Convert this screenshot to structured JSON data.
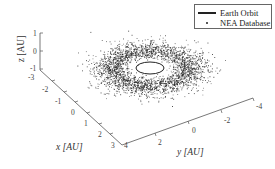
{
  "chart_data": {
    "type": "scatter",
    "projection": "3d",
    "title": "",
    "xlabel": "x [AU]",
    "ylabel": "y [AU]",
    "zlabel": "z [AU]",
    "xlim": [
      -3,
      4
    ],
    "ylim": [
      4,
      -4
    ],
    "zlim": [
      -1,
      1
    ],
    "x_ticks": [
      "-3",
      "-2",
      "-1",
      "0",
      "1",
      "2",
      "3"
    ],
    "y_ticks": [
      "4",
      "2",
      "0",
      "-2",
      "-4"
    ],
    "z_ticks": [
      "1",
      "0",
      "-1"
    ],
    "legend_position": "upper right",
    "grid": false,
    "series": [
      {
        "name": "Earth Orbit",
        "style": "line",
        "color": "#222222",
        "description": "circle of radius 1 AU in ecliptic plane"
      },
      {
        "name": "NEA Database",
        "style": "points",
        "color": "#222222",
        "description": "dense ring of near-Earth asteroids ~1-3 AU, thin in z"
      }
    ]
  },
  "legend": {
    "items": [
      {
        "label": "Earth Orbit"
      },
      {
        "label": "NEA Database"
      }
    ]
  }
}
